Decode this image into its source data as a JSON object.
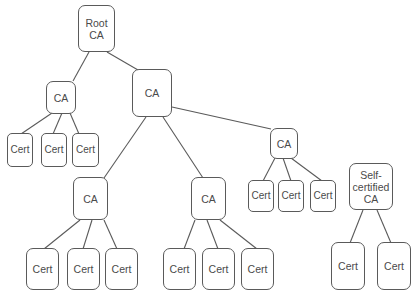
{
  "diagram": {
    "colors": {
      "stroke": "#5a5a5a",
      "text": "#4a4a4a",
      "background": "#ffffff"
    },
    "nodes": [
      {
        "id": "root",
        "label": "Root\nCA",
        "type": "ca",
        "x": 78,
        "y": 5,
        "w": 37,
        "h": 47
      },
      {
        "id": "ca_left",
        "label": "CA",
        "type": "ca",
        "x": 46,
        "y": 81,
        "w": 30,
        "h": 33
      },
      {
        "id": "ca_main",
        "label": "CA",
        "type": "ca",
        "x": 132,
        "y": 69,
        "w": 40,
        "h": 48
      },
      {
        "id": "ca_right",
        "label": "CA",
        "type": "ca",
        "x": 270,
        "y": 128,
        "w": 28,
        "h": 31
      },
      {
        "id": "ca_low1",
        "label": "CA",
        "type": "ca",
        "x": 73,
        "y": 177,
        "w": 35,
        "h": 43
      },
      {
        "id": "ca_low2",
        "label": "CA",
        "type": "ca",
        "x": 191,
        "y": 177,
        "w": 35,
        "h": 43
      },
      {
        "id": "ca_self",
        "label": "Self-\ncertified\nCA",
        "type": "ca",
        "x": 349,
        "y": 163,
        "w": 44,
        "h": 47
      },
      {
        "id": "c1",
        "label": "Cert",
        "type": "cert",
        "x": 7,
        "y": 133,
        "w": 26,
        "h": 34
      },
      {
        "id": "c2",
        "label": "Cert",
        "type": "cert",
        "x": 41,
        "y": 133,
        "w": 26,
        "h": 34
      },
      {
        "id": "c3",
        "label": "Cert",
        "type": "cert",
        "x": 72,
        "y": 133,
        "w": 27,
        "h": 34
      },
      {
        "id": "c4",
        "label": "Cert",
        "type": "cert",
        "x": 248,
        "y": 180,
        "w": 26,
        "h": 32
      },
      {
        "id": "c5",
        "label": "Cert",
        "type": "cert",
        "x": 278,
        "y": 180,
        "w": 26,
        "h": 32
      },
      {
        "id": "c6",
        "label": "Cert",
        "type": "cert",
        "x": 310,
        "y": 180,
        "w": 26,
        "h": 32
      },
      {
        "id": "c7",
        "label": "Cert",
        "type": "cert",
        "x": 26,
        "y": 248,
        "w": 33,
        "h": 42
      },
      {
        "id": "c8",
        "label": "Cert",
        "type": "cert",
        "x": 67,
        "y": 248,
        "w": 33,
        "h": 42
      },
      {
        "id": "c9",
        "label": "Cert",
        "type": "cert",
        "x": 105,
        "y": 248,
        "w": 33,
        "h": 42
      },
      {
        "id": "c10",
        "label": "Cert",
        "type": "cert",
        "x": 163,
        "y": 248,
        "w": 33,
        "h": 42
      },
      {
        "id": "c11",
        "label": "Cert",
        "type": "cert",
        "x": 202,
        "y": 248,
        "w": 33,
        "h": 42
      },
      {
        "id": "c12",
        "label": "Cert",
        "type": "cert",
        "x": 241,
        "y": 248,
        "w": 33,
        "h": 42
      },
      {
        "id": "c13",
        "label": "Cert",
        "type": "cert",
        "x": 331,
        "y": 242,
        "w": 34,
        "h": 48
      },
      {
        "id": "c14",
        "label": "Cert",
        "type": "cert",
        "x": 377,
        "y": 242,
        "w": 34,
        "h": 48
      }
    ],
    "edges": [
      {
        "from": "root",
        "to": "ca_left",
        "x1": 89,
        "y1": 52,
        "x2": 73,
        "y2": 81
      },
      {
        "from": "root",
        "to": "ca_main",
        "x1": 107,
        "y1": 52,
        "x2": 138,
        "y2": 70
      },
      {
        "from": "ca_left",
        "to": "c1",
        "x1": 52,
        "y1": 113,
        "x2": 21,
        "y2": 134
      },
      {
        "from": "ca_left",
        "to": "c2",
        "x1": 62,
        "y1": 113,
        "x2": 53,
        "y2": 134
      },
      {
        "from": "ca_left",
        "to": "c3",
        "x1": 70,
        "y1": 113,
        "x2": 79,
        "y2": 134
      },
      {
        "from": "ca_main",
        "to": "ca_right",
        "x1": 172,
        "y1": 107,
        "x2": 271,
        "y2": 129
      },
      {
        "from": "ca_main",
        "to": "ca_low1",
        "x1": 146,
        "y1": 117,
        "x2": 104,
        "y2": 178
      },
      {
        "from": "ca_main",
        "to": "ca_low2",
        "x1": 163,
        "y1": 117,
        "x2": 203,
        "y2": 178
      },
      {
        "from": "ca_right",
        "to": "c4",
        "x1": 275,
        "y1": 158,
        "x2": 263,
        "y2": 181
      },
      {
        "from": "ca_right",
        "to": "c5",
        "x1": 283,
        "y1": 158,
        "x2": 291,
        "y2": 181
      },
      {
        "from": "ca_right",
        "to": "c6",
        "x1": 291,
        "y1": 158,
        "x2": 322,
        "y2": 181
      },
      {
        "from": "ca_low1",
        "to": "c7",
        "x1": 80,
        "y1": 220,
        "x2": 44,
        "y2": 249
      },
      {
        "from": "ca_low1",
        "to": "c8",
        "x1": 92,
        "y1": 220,
        "x2": 83,
        "y2": 249
      },
      {
        "from": "ca_low1",
        "to": "c9",
        "x1": 104,
        "y1": 220,
        "x2": 117,
        "y2": 249
      },
      {
        "from": "ca_low2",
        "to": "c10",
        "x1": 195,
        "y1": 220,
        "x2": 184,
        "y2": 249
      },
      {
        "from": "ca_low2",
        "to": "c11",
        "x1": 207,
        "y1": 220,
        "x2": 218,
        "y2": 249
      },
      {
        "from": "ca_low2",
        "to": "c12",
        "x1": 220,
        "y1": 220,
        "x2": 257,
        "y2": 249
      },
      {
        "from": "ca_self",
        "to": "c13",
        "x1": 363,
        "y1": 210,
        "x2": 350,
        "y2": 243
      },
      {
        "from": "ca_self",
        "to": "c14",
        "x1": 377,
        "y1": 210,
        "x2": 391,
        "y2": 243
      }
    ]
  }
}
